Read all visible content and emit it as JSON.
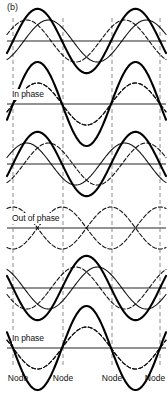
{
  "figure": {
    "part_label": "(b)",
    "caption": "",
    "background_color": "#ffffff",
    "width": 168,
    "height": 393
  },
  "axis": {
    "line_color": "#6e6e6e",
    "node_line_color": "#8c8c8c",
    "wave_a_color": "#111111",
    "wave_b_color": "#111111",
    "resultant_color": "#000000"
  },
  "node_lines": {
    "label": "Node",
    "x_positions": [
      13,
      63,
      112,
      160
    ],
    "labels": [
      "Node",
      "Node",
      "Node",
      "Node"
    ]
  },
  "panel_labels": [
    {
      "text": "In phase",
      "panel": 2
    },
    {
      "text": "Out of phase",
      "panel": 4
    },
    {
      "text": "In phase",
      "panel": 6
    }
  ],
  "chart_data": {
    "type": "line",
    "xlabel": "",
    "ylabel": "",
    "xlim": [
      0,
      1
    ],
    "ylim": [
      -1,
      1
    ],
    "grid": false,
    "legend": "none",
    "annotations": [
      "(b)",
      "In phase",
      "Out of phase",
      "In phase",
      "Node",
      "Node",
      "Node",
      "Node"
    ],
    "node_x_fractions": [
      0.0,
      0.3333,
      0.6667,
      1.0
    ],
    "wavelength_fraction": 0.6667,
    "panels": [
      {
        "index": 1,
        "label": "",
        "y_center": 41,
        "amplitude": 21,
        "series": [
          {
            "name": "wave-right",
            "style": "solid",
            "phase_deg": -40,
            "amplitude": 1.0
          },
          {
            "name": "wave-left",
            "style": "dashed",
            "phase_deg": 40,
            "amplitude": 1.0
          },
          {
            "name": "resultant",
            "style": "solid-bold",
            "phase_deg": 0,
            "amplitude": 1.53
          }
        ]
      },
      {
        "index": 2,
        "label": "In phase",
        "y_center": 104,
        "amplitude": 21,
        "series": [
          {
            "name": "wave-right",
            "style": "dashed",
            "phase_deg": 0,
            "amplitude": 1.0
          },
          {
            "name": "wave-left",
            "style": "dashed",
            "phase_deg": 0,
            "amplitude": 1.0
          },
          {
            "name": "resultant",
            "style": "solid-bold",
            "phase_deg": 0,
            "amplitude": 2.0
          }
        ]
      },
      {
        "index": 3,
        "label": "",
        "y_center": 164,
        "amplitude": 21,
        "series": [
          {
            "name": "wave-right",
            "style": "solid",
            "phase_deg": 40,
            "amplitude": 1.0
          },
          {
            "name": "wave-left",
            "style": "dashed",
            "phase_deg": -40,
            "amplitude": 1.0
          },
          {
            "name": "resultant",
            "style": "solid-bold",
            "phase_deg": 0,
            "amplitude": 1.53
          }
        ]
      },
      {
        "index": 4,
        "label": "Out of phase",
        "y_center": 228,
        "amplitude": 21,
        "series": [
          {
            "name": "wave-right",
            "style": "dashed",
            "phase_deg": 90,
            "amplitude": 1.0
          },
          {
            "name": "wave-left",
            "style": "dashed",
            "phase_deg": -90,
            "amplitude": 1.0
          },
          {
            "name": "resultant",
            "style": "solid-bold",
            "phase_deg": 0,
            "amplitude": 0.0
          }
        ]
      },
      {
        "index": 5,
        "label": "",
        "y_center": 288,
        "amplitude": 21,
        "series": [
          {
            "name": "wave-right",
            "style": "solid",
            "phase_deg": 140,
            "amplitude": 1.0
          },
          {
            "name": "wave-left",
            "style": "dashed",
            "phase_deg": -140,
            "amplitude": 1.0
          },
          {
            "name": "resultant",
            "style": "solid-bold",
            "phase_deg": 180,
            "amplitude": 1.53
          }
        ]
      },
      {
        "index": 6,
        "label": "In phase",
        "y_center": 348,
        "amplitude": 21,
        "series": [
          {
            "name": "wave-right",
            "style": "dashed",
            "phase_deg": 180,
            "amplitude": 1.0
          },
          {
            "name": "wave-left",
            "style": "dashed",
            "phase_deg": 180,
            "amplitude": 1.0
          },
          {
            "name": "resultant",
            "style": "solid-bold",
            "phase_deg": 180,
            "amplitude": 2.0
          }
        ]
      }
    ]
  }
}
